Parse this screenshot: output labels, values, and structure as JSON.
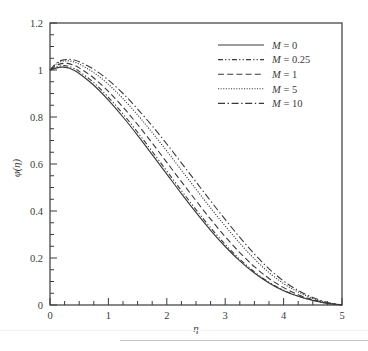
{
  "chart_data": {
    "type": "line",
    "title": "",
    "xlabel": "η",
    "ylabel": "φ(η)",
    "xlim": [
      0,
      5
    ],
    "ylim": [
      0,
      1.2
    ],
    "xticks": [
      0,
      1,
      2,
      3,
      4,
      5
    ],
    "xticklabels": [
      "0",
      "1",
      "2",
      "3",
      "4",
      "5"
    ],
    "yticks": [
      0,
      0.2,
      0.4,
      0.6,
      0.8,
      1,
      1.2
    ],
    "yticklabels": [
      "0",
      "0.2",
      "0.4",
      "0.6",
      "0.8",
      "1",
      "1.2"
    ],
    "x_minor_step": 0.25,
    "y_minor_step": 0.05,
    "grid": false,
    "legend_position": "top-right",
    "legend_title": "",
    "x": [
      0,
      0.1,
      0.2,
      0.3,
      0.4,
      0.5,
      0.75,
      1,
      1.25,
      1.5,
      1.75,
      2,
      2.25,
      2.5,
      2.75,
      3,
      3.25,
      3.5,
      3.75,
      4,
      4.25,
      4.5,
      4.75,
      5
    ],
    "series": [
      {
        "name": "M = 0",
        "label_prefix": "M",
        "label_value": "0",
        "style": "solid",
        "color": "#3a3a3a",
        "values": [
          1.0,
          1.008,
          1.012,
          1.01,
          1.0,
          0.985,
          0.935,
          0.872,
          0.8,
          0.722,
          0.64,
          0.557,
          0.474,
          0.394,
          0.318,
          0.249,
          0.188,
          0.136,
          0.094,
          0.061,
          0.037,
          0.019,
          0.007,
          0.0
        ]
      },
      {
        "name": "M = 0.25",
        "label_prefix": "M",
        "label_value": "0.25",
        "style": "dash-dot-fine",
        "color": "#3a3a3a",
        "values": [
          1.0,
          1.012,
          1.018,
          1.017,
          1.008,
          0.994,
          0.946,
          0.884,
          0.813,
          0.735,
          0.653,
          0.57,
          0.487,
          0.406,
          0.329,
          0.258,
          0.195,
          0.141,
          0.097,
          0.063,
          0.038,
          0.02,
          0.007,
          0.0
        ]
      },
      {
        "name": "M = 1",
        "label_prefix": "M",
        "label_value": "1",
        "style": "dashed",
        "color": "#3a3a3a",
        "values": [
          1.0,
          1.018,
          1.027,
          1.028,
          1.021,
          1.009,
          0.966,
          0.909,
          0.842,
          0.768,
          0.689,
          0.607,
          0.525,
          0.444,
          0.365,
          0.291,
          0.223,
          0.163,
          0.113,
          0.074,
          0.044,
          0.023,
          0.008,
          0.0
        ]
      },
      {
        "name": "M = 5",
        "label_prefix": "M",
        "label_value": "5",
        "style": "dotted",
        "color": "#3a3a3a",
        "values": [
          1.0,
          1.024,
          1.036,
          1.039,
          1.035,
          1.025,
          0.989,
          0.939,
          0.878,
          0.809,
          0.734,
          0.655,
          0.574,
          0.493,
          0.413,
          0.336,
          0.263,
          0.196,
          0.138,
          0.091,
          0.055,
          0.028,
          0.01,
          0.0
        ]
      },
      {
        "name": "M = 10",
        "label_prefix": "M",
        "label_value": "10",
        "style": "dash-dot",
        "color": "#3a3a3a",
        "values": [
          1.0,
          1.027,
          1.041,
          1.045,
          1.043,
          1.035,
          1.003,
          0.957,
          0.9,
          0.834,
          0.762,
          0.685,
          0.605,
          0.524,
          0.443,
          0.364,
          0.288,
          0.217,
          0.154,
          0.102,
          0.062,
          0.032,
          0.011,
          0.0
        ]
      }
    ]
  },
  "axes": {
    "x_axis_label": "η",
    "y_axis_label": "φ(η)"
  }
}
